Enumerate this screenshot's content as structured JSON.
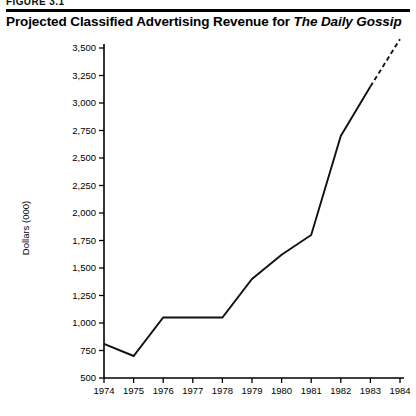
{
  "figure": {
    "number_label": "FIGURE 3.1"
  },
  "title": {
    "lead": "Projected Classified Advertising Revenue for ",
    "publication": "The Daily Gossip"
  },
  "chart_data": {
    "type": "line",
    "title": "Projected Classified Advertising Revenue for The Daily Gossip",
    "subtitle": "",
    "xlabel": "",
    "ylabel": "Dollars (000)",
    "categories": [
      "1974",
      "1975",
      "1976",
      "1977",
      "1978",
      "1979",
      "1980",
      "1981",
      "1982",
      "1983",
      "1984"
    ],
    "x": [
      1974,
      1975,
      1976,
      1977,
      1978,
      1979,
      1980,
      1981,
      1982,
      1983,
      1984
    ],
    "values": [
      810,
      700,
      1050,
      1050,
      1050,
      1400,
      1620,
      1800,
      2700,
      3150,
      3580
    ],
    "series": [
      {
        "name": "Classified advertising revenue",
        "values": [
          810,
          700,
          1050,
          1050,
          1050,
          1400,
          1620,
          1800,
          2700,
          3150,
          3580
        ],
        "style": "solid-then-dashed",
        "solid_through_index": 9,
        "dashed_note": "projected"
      }
    ],
    "ylim": [
      500,
      3500
    ],
    "xlim": [
      1974,
      1984
    ],
    "y_ticks": [
      500,
      750,
      1000,
      1250,
      1500,
      1750,
      2000,
      2250,
      2500,
      2750,
      3000,
      3250,
      3500
    ],
    "y_tick_labels": [
      "500",
      "750",
      "1,000",
      "1,250",
      "1,500",
      "1,750",
      "2,000",
      "2,250",
      "2,500",
      "2,750",
      "3,000",
      "3,250",
      "3,500"
    ],
    "x_tick_labels": [
      "1974",
      "1975",
      "1976",
      "1977",
      "1978",
      "1979",
      "1980",
      "1981",
      "1982",
      "1983",
      "1984"
    ],
    "grid": false,
    "legend": "none",
    "legend_position": "none",
    "line_color": "#111111",
    "background_color": "#ffffff"
  }
}
